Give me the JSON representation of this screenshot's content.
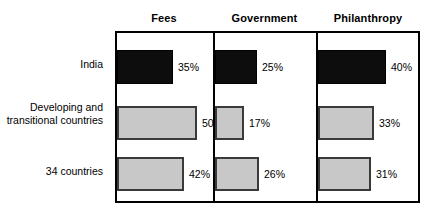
{
  "chart_data": {
    "type": "bar",
    "title": "",
    "xlabel": "",
    "ylabel": "",
    "orientation": "horizontal",
    "grid": false,
    "legend": "none",
    "value_suffix": "%",
    "axis_max": 60,
    "categories": [
      "India",
      "Developing and\ntransitional countries",
      "34 countries"
    ],
    "columns": [
      "Fees",
      "Government",
      "Philanthropy"
    ],
    "series": [
      {
        "name": "Fees",
        "values": [
          35,
          50,
          42
        ],
        "labels": [
          "35%",
          "50%",
          "42%"
        ]
      },
      {
        "name": "Government",
        "values": [
          25,
          17,
          26
        ],
        "labels": [
          "25%",
          "17%",
          "26%"
        ]
      },
      {
        "name": "Philanthropy",
        "values": [
          40,
          33,
          31
        ],
        "labels": [
          "40%",
          "33%",
          "31%"
        ]
      }
    ],
    "row_styles": [
      "dark",
      "light",
      "light"
    ],
    "colors": {
      "dark_bar_fill": "#0d0d0d",
      "dark_bar_border": "#000000",
      "light_bar_fill": "#c8c8c8",
      "light_bar_border": "#3a3a3a",
      "frame": "#000000",
      "background": "#ffffff",
      "text": "#000000"
    }
  },
  "headers": {
    "fees": "Fees",
    "government": "Government",
    "philanthropy": "Philanthropy"
  },
  "rows": {
    "india": "India",
    "developing": "Developing and\ntransitional countries",
    "countries34": "34 countries"
  },
  "values": {
    "india_fees": "35%",
    "india_government": "25%",
    "india_philanthropy": "40%",
    "developing_fees": "50%",
    "developing_government": "17%",
    "developing_philanthropy": "33%",
    "countries34_fees": "42%",
    "countries34_government": "26%",
    "countries34_philanthropy": "31%"
  }
}
